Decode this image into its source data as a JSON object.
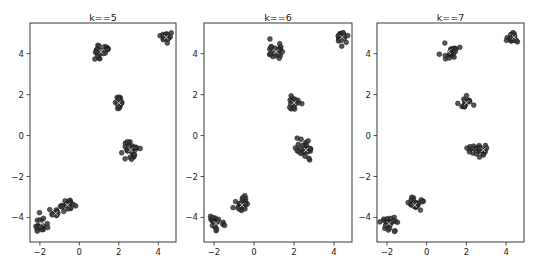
{
  "figure": {
    "width": 537,
    "height": 267
  },
  "chart_data": [
    {
      "type": "scatter",
      "title": "k==5",
      "xlabel": "",
      "ylabel": "",
      "xlim": [
        -2.5,
        4.9
      ],
      "ylim": [
        -5.2,
        5.5
      ],
      "xticks": [
        -2,
        0,
        2,
        4
      ],
      "yticks": [
        -4,
        -2,
        0,
        2,
        4
      ],
      "grid": false,
      "frame_px": {
        "x0": 30,
        "x1": 176,
        "y0": 23,
        "y1": 242
      },
      "point_color": "#3a3a3a",
      "clusters": [
        {
          "cx": 1.1,
          "cy": 4.1,
          "spread": 0.22,
          "n": 22
        },
        {
          "cx": 4.4,
          "cy": 4.8,
          "spread": 0.14,
          "n": 16
        },
        {
          "cx": 2.0,
          "cy": 1.6,
          "spread": 0.16,
          "n": 18
        },
        {
          "cx": 2.6,
          "cy": -0.7,
          "spread": 0.24,
          "n": 26
        },
        {
          "cx": -0.6,
          "cy": -3.4,
          "spread": 0.2,
          "n": 20
        },
        {
          "cx": -1.2,
          "cy": -3.8,
          "spread": 0.12,
          "n": 10
        },
        {
          "cx": -1.9,
          "cy": -4.3,
          "spread": 0.2,
          "n": 20
        }
      ]
    },
    {
      "type": "scatter",
      "title": "k==6",
      "xlabel": "",
      "ylabel": "",
      "xlim": [
        -2.5,
        4.9
      ],
      "ylim": [
        -5.2,
        5.5
      ],
      "xticks": [
        -2,
        0,
        2,
        4
      ],
      "yticks": [
        -4,
        -2,
        0,
        2,
        4
      ],
      "grid": false,
      "frame_px": {
        "x0": 204,
        "x1": 352,
        "y0": 23,
        "y1": 242
      },
      "point_color": "#3a3a3a",
      "clusters": [
        {
          "cx": 1.1,
          "cy": 4.1,
          "spread": 0.24,
          "n": 22
        },
        {
          "cx": 4.4,
          "cy": 4.8,
          "spread": 0.14,
          "n": 16
        },
        {
          "cx": 2.0,
          "cy": 1.6,
          "spread": 0.16,
          "n": 18
        },
        {
          "cx": 2.6,
          "cy": -0.7,
          "spread": 0.24,
          "n": 26
        },
        {
          "cx": -0.6,
          "cy": -3.4,
          "spread": 0.2,
          "n": 22
        },
        {
          "cx": -1.9,
          "cy": -4.3,
          "spread": 0.2,
          "n": 22
        }
      ]
    },
    {
      "type": "scatter",
      "title": "k==7",
      "xlabel": "",
      "ylabel": "",
      "xlim": [
        -2.5,
        4.9
      ],
      "ylim": [
        -5.2,
        5.5
      ],
      "xticks": [
        -2,
        0,
        2,
        4
      ],
      "yticks": [
        -4,
        -2,
        0,
        2,
        4
      ],
      "grid": false,
      "frame_px": {
        "x0": 377,
        "x1": 524,
        "y0": 23,
        "y1": 242
      },
      "point_color": "#3a3a3a",
      "clusters": [
        {
          "cx": 1.1,
          "cy": 4.1,
          "spread": 0.22,
          "n": 22
        },
        {
          "cx": 4.4,
          "cy": 4.8,
          "spread": 0.14,
          "n": 16
        },
        {
          "cx": 2.0,
          "cy": 1.6,
          "spread": 0.16,
          "n": 18
        },
        {
          "cx": 2.4,
          "cy": -0.7,
          "spread": 0.16,
          "n": 14
        },
        {
          "cx": 2.85,
          "cy": -0.7,
          "spread": 0.16,
          "n": 14
        },
        {
          "cx": -0.6,
          "cy": -3.4,
          "spread": 0.2,
          "n": 22
        },
        {
          "cx": -1.9,
          "cy": -4.3,
          "spread": 0.2,
          "n": 22
        }
      ]
    }
  ]
}
